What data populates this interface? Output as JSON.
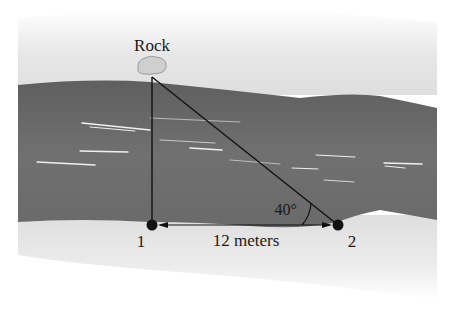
{
  "diagram": {
    "labels": {
      "rock": "Rock",
      "point1": "1",
      "point2": "2",
      "distance": "12 meters",
      "angle": "40°"
    },
    "geometry": {
      "angle_degrees": 40,
      "baseline_length": "12 meters"
    },
    "colors": {
      "river": "#6f6f6f",
      "bank": "#e2e2e2",
      "lines": "#111111",
      "rock_fill": "#cfcfcf",
      "ripples": "#f2f2f2"
    }
  }
}
